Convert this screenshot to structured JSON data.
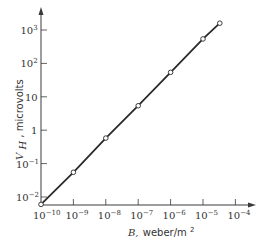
{
  "chart_data": {
    "type": "line",
    "title": "",
    "xlabel": "B, weber/m²",
    "ylabel": "V_H, microvolts",
    "xscale": "log",
    "yscale": "log",
    "xlim": [
      1e-10,
      0.0001
    ],
    "ylim": [
      0.005,
      2000
    ],
    "grid": false,
    "legend": null,
    "x_ticks": [
      "10^-10",
      "10^-9",
      "10^-8",
      "10^-7",
      "10^-6",
      "10^-5",
      "10^-4"
    ],
    "y_ticks": [
      "10^-2",
      "10^-1",
      "1",
      "10",
      "10^2",
      "10^3"
    ],
    "series": [
      {
        "name": "V_H vs B",
        "marker": "open-circle",
        "line": "solid",
        "x": [
          1e-10,
          1e-09,
          1e-08,
          1e-07,
          1e-06,
          1e-05,
          3.3e-05
        ],
        "y": [
          0.006,
          0.055,
          0.58,
          5.4,
          54,
          540,
          1600
        ]
      }
    ]
  },
  "labels": {
    "x_axis_var": "B,",
    "x_axis_unit": "weber/m",
    "x_axis_unit_exp": "2",
    "y_axis_var": "V",
    "y_axis_sub": "H",
    "y_axis_unit": ", microvolts",
    "x_ticks": [
      {
        "base": "10",
        "exp": "−10"
      },
      {
        "base": "10",
        "exp": "−9"
      },
      {
        "base": "10",
        "exp": "−8"
      },
      {
        "base": "10",
        "exp": "−7"
      },
      {
        "base": "10",
        "exp": "−6"
      },
      {
        "base": "10",
        "exp": "−5"
      },
      {
        "base": "10",
        "exp": "−4"
      }
    ],
    "y_ticks": [
      {
        "base": "10",
        "exp": "3"
      },
      {
        "base": "10",
        "exp": "2"
      },
      {
        "base": "10",
        "exp": ""
      },
      {
        "base": "1",
        "exp": ""
      },
      {
        "base": "10",
        "exp": "−1"
      },
      {
        "base": "10",
        "exp": "−2"
      }
    ]
  },
  "colors": {
    "line": "#2a2a2a",
    "axis": "#3a3a3a",
    "marker_fill": "#ffffff"
  }
}
